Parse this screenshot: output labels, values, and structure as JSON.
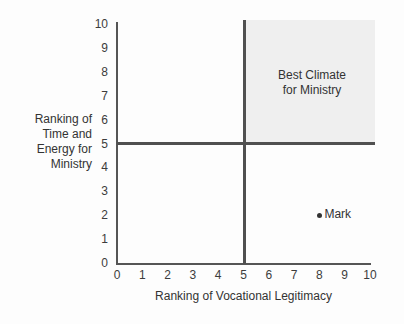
{
  "chart_data": {
    "type": "scatter",
    "title": "",
    "xlabel": "Ranking of Vocational Legitimacy",
    "ylabel": "Ranking of Time and Energy for Ministry",
    "ylabel_lines": [
      "Ranking of",
      "Time and",
      "Energy for",
      "Ministry"
    ],
    "xlim": [
      0,
      10
    ],
    "ylim": [
      0,
      10
    ],
    "x_ticks": [
      "0",
      "1",
      "2",
      "3",
      "4",
      "5",
      "6",
      "7",
      "8",
      "9",
      "10"
    ],
    "y_ticks": [
      "0",
      "1",
      "2",
      "3",
      "4",
      "5",
      "6",
      "7",
      "8",
      "9",
      "10"
    ],
    "grid": false,
    "divider_lines": {
      "x": 5,
      "y": 5
    },
    "shaded_region": {
      "label_lines": [
        "Best Climate",
        "for Ministry"
      ],
      "x_range": [
        5,
        10
      ],
      "y_range": [
        5,
        10
      ]
    },
    "points": [
      {
        "label": "Mark",
        "x": 8,
        "y": 2
      }
    ]
  },
  "labels": {
    "quadrant_line1": "Best Climate",
    "quadrant_line2": "for Ministry",
    "point_mark": "Mark",
    "xlabel": "Ranking of Vocational Legitimacy",
    "ylabel_1": "Ranking of",
    "ylabel_2": "Time and",
    "ylabel_3": "Energy for",
    "ylabel_4": "Ministry"
  }
}
